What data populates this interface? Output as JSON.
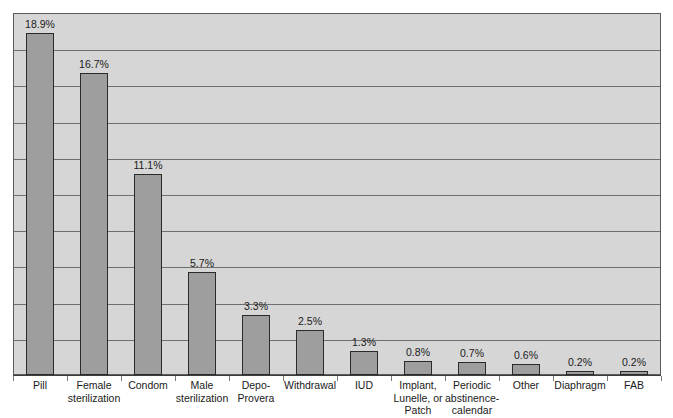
{
  "chart_data": {
    "type": "bar",
    "title": "",
    "subtitle": "",
    "xlabel": "",
    "ylabel": "",
    "ylim": [
      0,
      20
    ],
    "grid": true,
    "gridline_count": 9,
    "gridline_step": 2,
    "legend": "none",
    "value_label_suffix": "%",
    "categories": [
      "Pill",
      "Female sterilization",
      "Condom",
      "Male sterilization",
      "Depo-Provera",
      "Withdrawal",
      "IUD",
      "Implant, Lunelle, or Patch",
      "Periodic abstinence-calendar",
      "Other",
      "Diaphragm",
      "FAB"
    ],
    "values": [
      18.9,
      16.7,
      11.1,
      5.7,
      3.3,
      2.5,
      1.3,
      0.8,
      0.7,
      0.6,
      0.2,
      0.2
    ],
    "value_labels": [
      "18.9%",
      "16.7%",
      "11.1%",
      "5.7%",
      "3.3%",
      "2.5%",
      "1.3%",
      "0.8%",
      "0.7%",
      "0.6%",
      "0.2%",
      "0.2%"
    ],
    "category_label_lines": [
      [
        "Pill"
      ],
      [
        "Female",
        "sterilization"
      ],
      [
        "Condom"
      ],
      [
        "Male",
        "sterilization"
      ],
      [
        "Depo-",
        "Provera"
      ],
      [
        "Withdrawal"
      ],
      [
        "IUD"
      ],
      [
        "Implant,",
        "Lunelle, or",
        "Patch"
      ],
      [
        "Periodic",
        "abstinence-",
        "calendar"
      ],
      [
        "Other"
      ],
      [
        "Diaphragm"
      ],
      [
        "FAB"
      ]
    ]
  },
  "style": {
    "plot_background": "#d6d6d6",
    "bar_fill": "#9e9e9e",
    "bar_border": "#2b2b2b",
    "gridline_color": "#6e6e6e",
    "axis_color": "#3d3d3d",
    "text_color": "#1a1a1a",
    "page_background": "#ffffff"
  }
}
